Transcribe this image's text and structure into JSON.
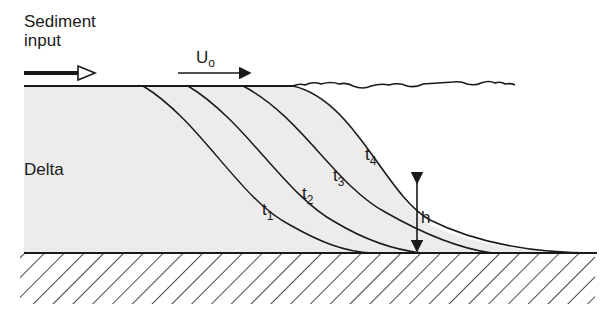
{
  "labels": {
    "sediment_input": "Sediment\ninput",
    "sediment_line1": "Sediment",
    "sediment_line2": "input",
    "velocity": "U",
    "velocity_sub": "o",
    "delta": "Delta",
    "height": "h",
    "t1": "t",
    "t1_sub": "1",
    "t2": "t",
    "t2_sub": "2",
    "t3": "t",
    "t3_sub": "3",
    "t4": "t",
    "t4_sub": "4"
  },
  "colors": {
    "ink": "#1a1a1a",
    "delta_fill": "#ececec",
    "background": "#ffffff"
  }
}
